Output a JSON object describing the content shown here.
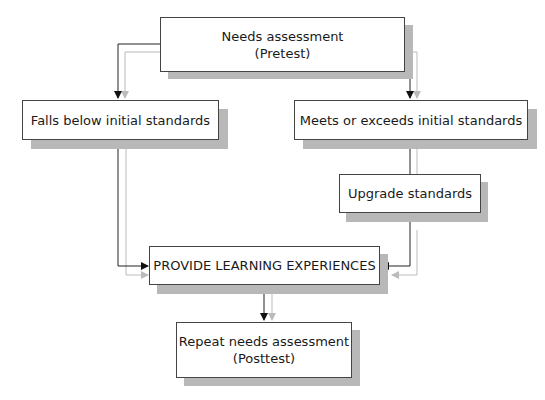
{
  "diagram": {
    "type": "flowchart",
    "nodes": [
      {
        "id": "needs",
        "line1": "Needs assessment",
        "line2": "(Pretest)"
      },
      {
        "id": "falls",
        "line1": "Falls below initial standards"
      },
      {
        "id": "meets",
        "line1": "Meets or exceeds initial standards"
      },
      {
        "id": "upgrade",
        "line1": "Upgrade standards"
      },
      {
        "id": "provide",
        "line1": "PROVIDE LEARNING EXPERIENCES"
      },
      {
        "id": "repeat",
        "line1": "Repeat needs assessment",
        "line2": "(Posttest)"
      }
    ],
    "edges": [
      {
        "from": "needs",
        "to": "falls"
      },
      {
        "from": "needs",
        "to": "meets"
      },
      {
        "from": "falls",
        "to": "provide"
      },
      {
        "from": "meets",
        "to": "upgrade"
      },
      {
        "from": "upgrade",
        "to": "provide"
      },
      {
        "from": "provide",
        "to": "repeat"
      }
    ],
    "colors": {
      "line": "#222222",
      "line_shadow": "#bbbbbb",
      "box_shadow": "#b8b8b8"
    }
  }
}
